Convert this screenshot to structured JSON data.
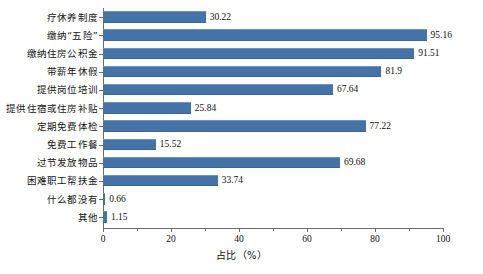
{
  "chart_data": {
    "type": "bar",
    "orientation": "horizontal",
    "title": "",
    "xlabel": "占比（%）",
    "ylabel": "",
    "xlim": [
      0,
      100
    ],
    "grid": false,
    "legend": false,
    "xticks": [
      "0",
      "20",
      "40",
      "60",
      "80",
      "100"
    ],
    "xtick_values": [
      0,
      20,
      40,
      60,
      80,
      100
    ],
    "xminor_ticks": [
      10,
      30,
      50,
      70,
      90
    ],
    "bar_color": "#4573a8",
    "categories": [
      "疗休养制度",
      "缴纳“五险”",
      "缴纳住房公积金",
      "带薪年休假",
      "提供岗位培训",
      "提供住宿或住房补贴",
      "定期免费体检",
      "免费工作餐",
      "过节发放物品",
      "困难职工帮扶金",
      "什么都没有",
      "其他"
    ],
    "values": [
      30.22,
      95.16,
      91.51,
      81.9,
      67.64,
      25.84,
      77.22,
      15.52,
      69.68,
      33.74,
      0.66,
      1.15
    ],
    "value_labels": [
      "30.22",
      "95.16",
      "91.51",
      "81.9",
      "67.64",
      "25.84",
      "77.22",
      "15.52",
      "69.68",
      "33.74",
      "0.66",
      "1.15"
    ]
  },
  "caption": ""
}
